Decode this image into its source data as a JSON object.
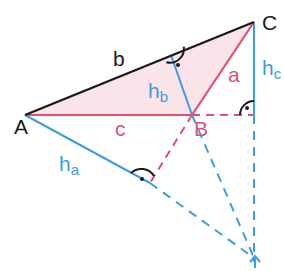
{
  "colors": {
    "side_b": "#1a1a1a",
    "side_red": "#e0506e",
    "altitude": "#3a9ee0",
    "fill": "#fbe3ea",
    "label_black": "#1a1a1a",
    "marker": "#1a1a1a"
  },
  "vertices": {
    "A": {
      "label": "A",
      "x": 25,
      "y": 115
    },
    "B": {
      "label": "B",
      "x": 192,
      "y": 115
    },
    "C": {
      "label": "C",
      "x": 254,
      "y": 22
    }
  },
  "feet": {
    "hb_foot": {
      "x": 171,
      "y": 55
    },
    "ha_foot": {
      "x": 150,
      "y": 183
    },
    "hc_foot": {
      "x": 254,
      "y": 115
    }
  },
  "orthocenter": {
    "x": 254,
    "y": 258
  },
  "labels": {
    "side_a": "a",
    "side_b": "b",
    "side_c": "c",
    "altitude_a_main": "h",
    "altitude_a_sub": "a",
    "altitude_b_main": "h",
    "altitude_b_sub": "b",
    "altitude_c_main": "h",
    "altitude_c_sub": "c",
    "vertex_A": "A",
    "vertex_B": "B",
    "vertex_C": "C"
  }
}
